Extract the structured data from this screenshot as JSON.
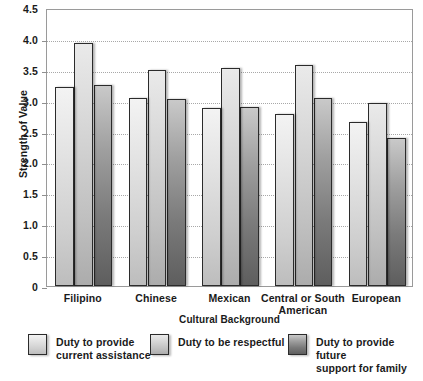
{
  "chart_data": {
    "type": "bar",
    "title": "",
    "xlabel": "Cultural Background",
    "ylabel": "Strength of Value",
    "categories": [
      "Filipino",
      "Chinese",
      "Mexican",
      "Central or South American",
      "European"
    ],
    "series": [
      {
        "name": "Duty to provide current assistance",
        "values": [
          3.22,
          3.05,
          2.88,
          2.78,
          2.65
        ],
        "color": "#e2e2e2"
      },
      {
        "name": "Duty to be respectful",
        "values": [
          3.93,
          3.5,
          3.53,
          3.58,
          2.97
        ],
        "color": "#d6d6d6"
      },
      {
        "name": "Duty to provide future support for family",
        "values": [
          3.25,
          3.02,
          2.9,
          3.04,
          2.4
        ],
        "color": "#8a8a8a"
      }
    ],
    "ylim": [
      0,
      4.5
    ],
    "yticks": [
      "0",
      "0.5",
      "1.0",
      "1.5",
      "2.0",
      "2.5",
      "3.0",
      "3.5",
      "4.0",
      "4.5"
    ],
    "ytick_values": [
      0,
      0.5,
      1.0,
      1.5,
      2.0,
      2.5,
      3.0,
      3.5,
      4.0,
      4.5
    ],
    "grid": true,
    "legend_position": "bottom"
  },
  "axis": {
    "y_title": "Strength of Value",
    "x_title": "Cultural Background"
  },
  "xlabels": [
    {
      "line1": "Filipino",
      "line2": ""
    },
    {
      "line1": "Chinese",
      "line2": ""
    },
    {
      "line1": "Mexican",
      "line2": ""
    },
    {
      "line1": "Central or South",
      "line2": "American"
    },
    {
      "line1": "European",
      "line2": ""
    }
  ],
  "legend": {
    "items": [
      {
        "line1": "Duty to provide",
        "line2": "current assistance"
      },
      {
        "line1": "Duty to be respectful",
        "line2": ""
      },
      {
        "line1": "Duty to provide future",
        "line2": "support for family"
      }
    ]
  }
}
